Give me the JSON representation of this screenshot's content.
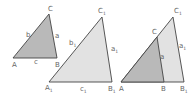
{
  "diagram": {
    "colors": {
      "stroke": "#444444",
      "fill_small": "#b9b9b9",
      "fill_large": "#e2e2e2",
      "label": "#666666"
    },
    "triangle1": {
      "vertices": {
        "A": "A",
        "B": "B",
        "C": "C"
      },
      "sides": {
        "a": "a",
        "b": "b",
        "c": "c"
      }
    },
    "triangle2": {
      "vertices": {
        "A1": "A",
        "B1": "B",
        "C1": "C"
      },
      "vertex_subscripts": {
        "A1": "1",
        "B1": "1",
        "C1": "1"
      },
      "sides": {
        "a1": "a",
        "b1": "b",
        "c1": "c"
      },
      "side_subscripts": {
        "a1": "1",
        "b1": "1",
        "c1": "1"
      }
    },
    "triangle3_overlay": {
      "vertices": {
        "A": "A",
        "B": "B",
        "C": "C",
        "B1": "B",
        "C1": "C"
      },
      "vertex_subscripts": {
        "B1": "1",
        "C1": "1"
      },
      "sides": {
        "a": "a",
        "a1": "a"
      },
      "side_subscripts": {
        "a1": "1"
      }
    }
  }
}
